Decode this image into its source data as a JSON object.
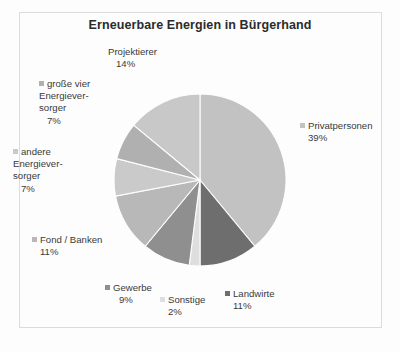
{
  "chart_data": {
    "type": "pie",
    "title": "Erneuerbare Energien in Bürgerhand",
    "xlabel": "",
    "ylabel": "",
    "legend_position": "around-slices",
    "grid": false,
    "total": 100,
    "unit": "%",
    "start_angle_deg": 0,
    "direction": "clockwise",
    "categories": [
      "Privatpersonen",
      "Landwirte",
      "Sonstige",
      "Gewerbe",
      "Fond / Banken",
      "andere Energiever-sorger",
      "große vier Energiever-sorger",
      "Projektierer"
    ],
    "values": [
      39,
      11,
      2,
      9,
      11,
      7,
      7,
      14
    ],
    "slices": [
      {
        "label": "Privatpersonen",
        "value": 39,
        "pct_text": "39%",
        "color": "#c2c2c2"
      },
      {
        "label": "Landwirte",
        "value": 11,
        "pct_text": "11%",
        "color": "#6e6e6e"
      },
      {
        "label": "Sonstige",
        "value": 2,
        "pct_text": "2%",
        "color": "#dedede"
      },
      {
        "label": "Gewerbe",
        "value": 9,
        "pct_text": "9%",
        "color": "#8f8f8f"
      },
      {
        "label": "Fond / Banken",
        "value": 11,
        "pct_text": "11%",
        "color": "#b8b8b8"
      },
      {
        "label": "andere Energiever- sorger",
        "value": 7,
        "pct_text": "7%",
        "color": "#cacaca"
      },
      {
        "label": "große vier Energiever- sorger",
        "value": 7,
        "pct_text": "7%",
        "color": "#b0b0b0"
      },
      {
        "label": "Projektierer",
        "value": 14,
        "pct_text": "14%",
        "color": "#c8c8c8"
      }
    ]
  },
  "labels": {
    "privatpersonen": {
      "line1": "Privatpersonen",
      "pct": "39%"
    },
    "landwirte": {
      "line1": "Landwirte",
      "pct": "11%"
    },
    "sonstige": {
      "line1": "Sonstige",
      "pct": "2%"
    },
    "gewerbe": {
      "line1": "Gewerbe",
      "pct": "9%"
    },
    "fond_banken": {
      "line1": "Fond / Banken",
      "pct": "11%"
    },
    "andere_ev": {
      "line1": "andere",
      "line2": "Energiever-",
      "line3": "sorger",
      "pct": "7%"
    },
    "grosse_vier_ev": {
      "line1": "große vier",
      "line2": "Energiever-",
      "line3": "sorger",
      "pct": "7%"
    },
    "projektierer": {
      "line1": "Projektierer",
      "pct": "14%"
    }
  },
  "colors": {
    "background": "#fdfdfd",
    "frame": "#dcdcdc",
    "title_text": "#2b2b2b",
    "label_text": "#3a3a3a"
  }
}
